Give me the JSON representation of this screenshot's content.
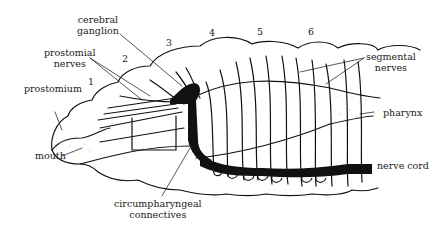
{
  "diagram": {
    "colors": {
      "ink": "#111111",
      "background": "#ffffff",
      "stipple": "#9a9a9a"
    },
    "labels": {
      "cerebral_ganglion": [
        "cerebral",
        "ganglion"
      ],
      "prostomial_nerves": [
        "prostomial",
        "nerves"
      ],
      "prostomium": "prostomium",
      "mouth": "mouth",
      "circumpharyngeal_connectives": [
        "circumpharyngeal",
        "connectives"
      ],
      "segmental_nerves": [
        "segmental",
        "nerves"
      ],
      "pharynx": "pharynx",
      "nerve_cord": "nerve cord"
    },
    "segment_numbers": [
      "1",
      "2",
      "3",
      "4",
      "5",
      "6"
    ]
  }
}
